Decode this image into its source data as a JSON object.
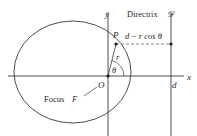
{
  "diagram": {
    "labels": {
      "x_axis": "x",
      "y_axis": "y",
      "directrix": "Directrix",
      "directrix_symbol": "𝒟",
      "point": "P",
      "distance_expr_d": "d",
      "distance_expr_rest": "− r cos θ",
      "radius": "r",
      "angle": "θ",
      "origin": "O",
      "focus": "Focus",
      "focus_symbol": "F",
      "d_tick": "d"
    },
    "colors": {
      "stroke": "#3a3a3a",
      "text": "#2a2a2a",
      "dashed": "#6a6a6a",
      "background": "#ffffff"
    }
  }
}
